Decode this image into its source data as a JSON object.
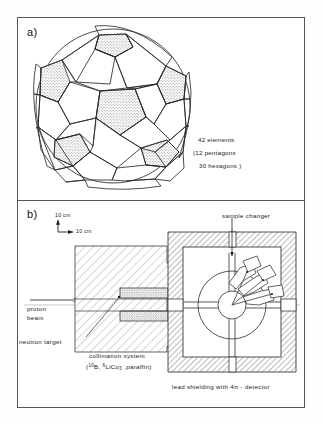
{
  "figure": {
    "panels": [
      {
        "id": "a",
        "label": "a)"
      },
      {
        "id": "b",
        "label": "b)"
      }
    ]
  },
  "panel_a": {
    "label": "a)",
    "geometry_name": "truncated-icosahedron-sphere",
    "notes": [
      "42 elements",
      "(12 pentagons",
      "30 hexagons )"
    ],
    "element_count": 42,
    "pentagon_count": 12,
    "hexagon_count": 30
  },
  "panel_b": {
    "label": "b)",
    "scale_bar": {
      "vertical_label": "10 cm",
      "horizontal_label": "10 cm"
    },
    "labels": {
      "sample_changer": "sample  changer",
      "proton_line1": "proton",
      "proton_line2": "beam",
      "neutron_target": "neutron  target",
      "collimation_line1": "collimation  system",
      "collimation_formula_pre": "(",
      "collimation_formula_b_sup": "10",
      "collimation_formula_b": "B, ",
      "collimation_formula_li_sup": "6",
      "collimation_formula_li": "LiCo",
      "collimation_formula_li_sub": "3",
      "collimation_formula_post": " ,paraffin)",
      "lead_shielding": "lead shielding  with   4π - detector"
    }
  },
  "colors": {
    "ink": "#1a1a1a",
    "frame": "#555555",
    "hatch": "#6b6b6b",
    "shade_fill": "#cfcfcf",
    "paper": "#fefefe",
    "axis_line": "#9a9a9a"
  }
}
